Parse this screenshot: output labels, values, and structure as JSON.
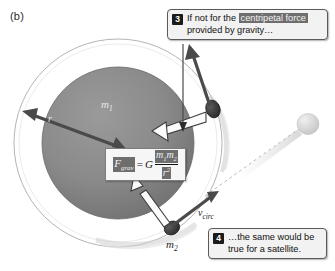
{
  "figure": {
    "panel_label": "(b)",
    "colors": {
      "planet_fill": "#8a8a8a",
      "planet_edge": "#6f6f6f",
      "orbit_ring": "#b0b0b0",
      "arrow_dark": "#4a4a4a",
      "arrow_white_fill": "#fbfbfb",
      "arrow_white_edge": "#3d3d3d",
      "callout_bg": "#f2f2f2",
      "callout_border": "#5a5a5a",
      "highlight_bg": "#6e6e6e",
      "satellite_dark": "#3a3a3a",
      "satellite_light": "#d8d8d8",
      "background": "#ffffff"
    }
  },
  "labels": {
    "central_mass": "m",
    "central_mass_sub": "1",
    "radius": "r",
    "orbiting_mass": "m",
    "orbiting_mass_sub": "2",
    "velocity": "v",
    "velocity_sub": "circ"
  },
  "equation": {
    "lhs_symbol": "F",
    "lhs_sub": "grav",
    "equals": "=",
    "constant": "G",
    "numerator_m1": "m",
    "numerator_m1_sub": "1",
    "numerator_m2": "m",
    "numerator_m2_sub": "2",
    "denominator": "r",
    "denominator_exp": "2"
  },
  "callouts": [
    {
      "number": "3",
      "text_before": "If not for the ",
      "highlighted": "centripetal force",
      "text_after": " provided by gravity…"
    },
    {
      "number": "4",
      "text_before": "…the same would be true for a satellite.",
      "highlighted": "",
      "text_after": ""
    }
  ]
}
